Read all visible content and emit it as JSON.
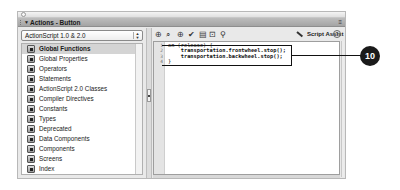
{
  "window": {
    "title": "Actions - Button"
  },
  "left_panel": {
    "version_dropdown": {
      "selected": "ActionScript 1.0 & 2.0"
    },
    "items": [
      {
        "label": "Global Functions",
        "selected": true
      },
      {
        "label": "Global Properties",
        "selected": false
      },
      {
        "label": "Operators",
        "selected": false
      },
      {
        "label": "Statements",
        "selected": false
      },
      {
        "label": "ActionScript 2.0 Classes",
        "selected": false
      },
      {
        "label": "Compiler Directives",
        "selected": false
      },
      {
        "label": "Constants",
        "selected": false
      },
      {
        "label": "Types",
        "selected": false
      },
      {
        "label": "Deprecated",
        "selected": false
      },
      {
        "label": "Data Components",
        "selected": false
      },
      {
        "label": "Components",
        "selected": false
      },
      {
        "label": "Screens",
        "selected": false
      },
      {
        "label": "Index",
        "selected": false
      }
    ]
  },
  "toolbar": {
    "icons": [
      {
        "name": "add-statement-icon",
        "glyph": "⊕"
      },
      {
        "name": "find-icon",
        "glyph": "⌕"
      },
      {
        "name": "insert-target-path-icon",
        "glyph": "⊕"
      },
      {
        "name": "check-syntax-icon",
        "glyph": "✔"
      },
      {
        "name": "auto-format-icon",
        "glyph": "▤"
      },
      {
        "name": "show-code-hint-icon",
        "glyph": "⊡"
      },
      {
        "name": "debug-options-icon",
        "glyph": "⚲"
      }
    ],
    "script_assist_label": "Script Assist",
    "help_glyph": "?"
  },
  "editor": {
    "lines": [
      {
        "num": "1",
        "text": "on (release) {"
      },
      {
        "num": "2",
        "text": "    transportation.frontwheel.stop();"
      },
      {
        "num": "3",
        "text": "    transportation.backwheel.stop();"
      },
      {
        "num": "4",
        "text": "}"
      }
    ]
  },
  "callout": {
    "number": "10"
  }
}
